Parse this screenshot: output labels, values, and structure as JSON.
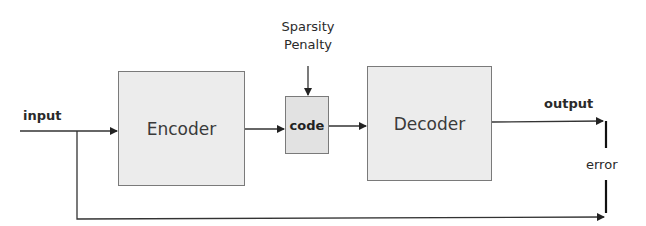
{
  "diagram": {
    "type": "sparse-autoencoder-block-diagram",
    "nodes": {
      "encoder": {
        "label": "Encoder"
      },
      "code": {
        "label": "code"
      },
      "decoder": {
        "label": "Decoder"
      }
    },
    "labels": {
      "input": "input",
      "output": "output",
      "error": "error",
      "penalty_line1": "Sparsity",
      "penalty_line2": "Penalty"
    },
    "edges": [
      {
        "from": "input",
        "to": "encoder"
      },
      {
        "from": "encoder",
        "to": "code"
      },
      {
        "from": "sparsity-penalty",
        "to": "code"
      },
      {
        "from": "code",
        "to": "decoder"
      },
      {
        "from": "decoder",
        "to": "error",
        "label": "output"
      },
      {
        "from": "input",
        "to": "error"
      }
    ],
    "colors": {
      "box_fill": "#ececec",
      "box_border": "#7a7a7a",
      "line": "#333333"
    }
  }
}
